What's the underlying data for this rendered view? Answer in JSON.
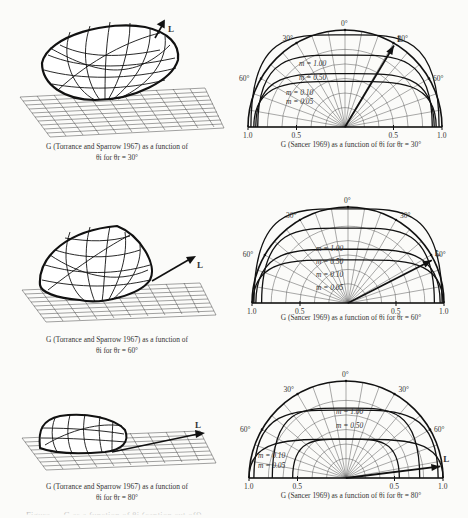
{
  "figure": {
    "rows": [
      {
        "theta_r_deg": 30,
        "left": {
          "title": "G (Torrance and Sparrow 1967) as a function of",
          "subtitle": "θi for  θr  = 30°",
          "vector_label": "L"
        },
        "right": {
          "caption": "G (Sancer 1969) as a function of  θi for  θr  = 30°",
          "vector_label": "L",
          "curve_labels": [
            "m = 1.00",
            "m = 0.50",
            "m = 0.10",
            "m = 0.05"
          ]
        }
      },
      {
        "theta_r_deg": 60,
        "left": {
          "title": "G (Torrance and Sparrow 1967) as a function of",
          "subtitle": "θi for  θr  = 60°",
          "vector_label": "L"
        },
        "right": {
          "caption": "G (Sancer 1969) as a function of θi for  θr  = 60°",
          "vector_label": "L",
          "curve_labels": [
            "m = 1.00",
            "m = 0.50",
            "m = 0.10",
            "m = 0.05"
          ]
        }
      },
      {
        "theta_r_deg": 80,
        "left": {
          "title": "G (Torrance and Sparrow 1967) as a function of",
          "subtitle": "θi for  θr  = 80°",
          "vector_label": "L"
        },
        "right": {
          "caption": "G (Sancer 1969) as a function of θi for  θr  = 80°",
          "vector_label": "L",
          "curve_labels": [
            "m = 1.00",
            "m = 0.50",
            "m = 0.10",
            "m = 0.05"
          ]
        }
      }
    ],
    "polar_axis": {
      "angle_labels": [
        "0°",
        "30°",
        "30°",
        "60°",
        "60°"
      ],
      "radial_tick_labels": [
        "1.0",
        "0.5",
        "0.5",
        "1.0"
      ]
    },
    "truncated_caption": "Figure — G as a function of θi (caption cut off)"
  },
  "chart_data": [
    {
      "type": "polar",
      "title": "G (Sancer 1969) as a function of θi for θr = 30°",
      "angle_ticks_deg": [
        -60,
        -30,
        0,
        30,
        60
      ],
      "radial_ticks": [
        0.5,
        1.0
      ],
      "rlim": [
        0,
        1.0
      ],
      "light_direction_deg": 30,
      "series": [
        {
          "name": "m = 1.00",
          "shape": "near-unit semicircle"
        },
        {
          "name": "m = 0.50",
          "shape": "slightly reduced lobe"
        },
        {
          "name": "m = 0.10",
          "shape": "reduced lobe toward grazing"
        },
        {
          "name": "m = 0.05",
          "shape": "smallest lobe"
        }
      ]
    },
    {
      "type": "polar",
      "title": "G (Sancer 1969) as a function of θi for θr = 60°",
      "angle_ticks_deg": [
        -60,
        -30,
        0,
        30,
        60
      ],
      "radial_ticks": [
        0.5,
        1.0
      ],
      "rlim": [
        0,
        1.0
      ],
      "light_direction_deg": 60,
      "series": [
        {
          "name": "m = 1.00"
        },
        {
          "name": "m = 0.50"
        },
        {
          "name": "m = 0.10"
        },
        {
          "name": "m = 0.05"
        }
      ]
    },
    {
      "type": "polar",
      "title": "G (Sancer 1969) as a function of θi for θr = 80°",
      "angle_ticks_deg": [
        -60,
        -30,
        0,
        30,
        60
      ],
      "radial_ticks": [
        0.5,
        1.0
      ],
      "rlim": [
        0,
        1.0
      ],
      "light_direction_deg": 80,
      "series": [
        {
          "name": "m = 1.00"
        },
        {
          "name": "m = 0.50"
        },
        {
          "name": "m = 0.10"
        },
        {
          "name": "m = 0.05"
        }
      ]
    }
  ]
}
